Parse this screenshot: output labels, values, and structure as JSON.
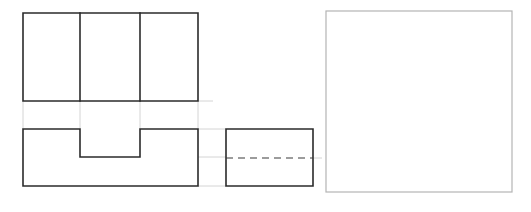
{
  "drawing": {
    "title": "Orthographic Projection — Three View Layout",
    "background_color": "#ffffff",
    "object_line_color": "#2b2b2b",
    "hidden_line_color": "#3a3a3a",
    "construction_line_color": "#cfcfcf",
    "light_rect_color": "#b4b4b4",
    "canvas": {
      "width": 531,
      "height": 212
    }
  },
  "views": {
    "top_view": {
      "name": "Top View",
      "outline": {
        "x": 23,
        "y": 13,
        "width": 175,
        "height": 88
      },
      "internal_vertical_lines_x": [
        80,
        140
      ],
      "path": "M23,13 L198,13 L198,101 L23,101 Z"
    },
    "front_view": {
      "name": "Front View",
      "bounds": {
        "x": 23,
        "y": 129,
        "width": 175,
        "height": 57
      },
      "notch": {
        "x": 80,
        "y": 129,
        "width": 60,
        "height": 28
      },
      "path": "M23,129 L80,129 L80,157 L140,157 L140,129 L198,129 L198,186 L23,186 Z"
    },
    "side_view": {
      "name": "Side View",
      "outline": {
        "x": 226,
        "y": 129,
        "width": 87,
        "height": 57
      },
      "hidden_line": {
        "x1": 226,
        "y1": 158,
        "x2": 313,
        "y2": 158
      },
      "path": "M226,129 L313,129 L313,186 L226,186 Z"
    },
    "isometric_panel": {
      "name": "Pictorial Panel",
      "outline": {
        "x": 326,
        "y": 11,
        "width": 186,
        "height": 181
      },
      "path": "M326,11 L512,11 L512,192 L326,192 Z"
    }
  },
  "construction_lines": [
    {
      "name": "left-edge-projector",
      "x1": 23,
      "y1": 101,
      "x2": 23,
      "y2": 129
    },
    {
      "name": "notch-left-projector",
      "x1": 80,
      "y1": 101,
      "x2": 80,
      "y2": 129
    },
    {
      "name": "notch-right-projector",
      "x1": 140,
      "y1": 101,
      "x2": 140,
      "y2": 129
    },
    {
      "name": "right-edge-projector",
      "x1": 198,
      "y1": 101,
      "x2": 198,
      "y2": 129
    },
    {
      "name": "front-top-extension",
      "x1": 198,
      "y1": 129,
      "x2": 226,
      "y2": 129
    },
    {
      "name": "front-notch-extension",
      "x1": 140,
      "y1": 157,
      "x2": 226,
      "y2": 157
    },
    {
      "name": "front-base-extension",
      "x1": 198,
      "y1": 186,
      "x2": 226,
      "y2": 186
    },
    {
      "name": "top-view-bottom-extension",
      "x1": 198,
      "y1": 101,
      "x2": 213,
      "y2": 101
    },
    {
      "name": "side-view-right-extension",
      "x1": 313,
      "y1": 158,
      "x2": 322,
      "y2": 158
    }
  ],
  "labels": {
    "top_view_label": "",
    "front_view_label": "",
    "side_view_label": ""
  }
}
